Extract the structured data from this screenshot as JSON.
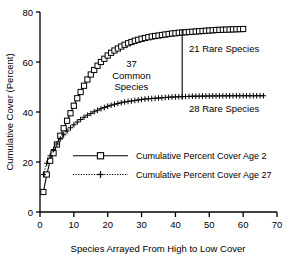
{
  "chart_data": {
    "type": "line",
    "title": "",
    "xlabel": "Species Arrayed From High to Low Cover",
    "ylabel": "Cumulative Cover (Percent)",
    "xlim": [
      0,
      70
    ],
    "ylim": [
      0,
      80
    ],
    "xticks": [
      0,
      10,
      20,
      30,
      40,
      50,
      60,
      70
    ],
    "yticks": [
      0,
      20,
      40,
      60,
      80
    ],
    "grid": false,
    "legend_position": "center-left-inside",
    "series": [
      {
        "name": "Cumulative Percent Cover Age 2",
        "marker": "open-square",
        "linestyle": "solid",
        "color": "#000000",
        "x": [
          1,
          2,
          3,
          4,
          5,
          6,
          7,
          8,
          9,
          10,
          11,
          12,
          13,
          14,
          15,
          16,
          17,
          18,
          19,
          20,
          21,
          22,
          23,
          24,
          25,
          26,
          27,
          28,
          29,
          30,
          31,
          32,
          33,
          34,
          35,
          36,
          37,
          38,
          39,
          40,
          41,
          42,
          43,
          44,
          45,
          46,
          47,
          48,
          49,
          50,
          51,
          52,
          53,
          54,
          55,
          56,
          57,
          58,
          59,
          60
        ],
        "y": [
          8.0,
          15.0,
          20.5,
          23.5,
          27.0,
          30.5,
          33.5,
          36.5,
          39.5,
          42.5,
          45.5,
          48.0,
          50.5,
          53.0,
          55.0,
          56.8,
          58.5,
          60.0,
          61.3,
          62.6,
          63.7,
          64.6,
          65.4,
          66.2,
          66.9,
          67.5,
          68.0,
          68.5,
          68.9,
          69.3,
          69.6,
          69.9,
          70.2,
          70.4,
          70.6,
          70.8,
          71.0,
          71.2,
          71.4,
          71.5,
          71.7,
          71.8,
          71.9,
          72.0,
          72.1,
          72.2,
          72.3,
          72.4,
          72.5,
          72.6,
          72.7,
          72.8,
          72.85,
          72.9,
          72.95,
          73.0,
          73.05,
          73.1,
          73.15,
          73.2
        ]
      },
      {
        "name": "Cumulative Percent Cover Age 27",
        "marker": "plus",
        "linestyle": "dotted",
        "color": "#000000",
        "x": [
          1,
          2,
          3,
          4,
          5,
          6,
          7,
          8,
          9,
          10,
          11,
          12,
          13,
          14,
          15,
          16,
          17,
          18,
          19,
          20,
          21,
          22,
          23,
          24,
          25,
          26,
          27,
          28,
          29,
          30,
          31,
          32,
          33,
          34,
          35,
          36,
          37,
          38,
          39,
          40,
          41,
          42,
          43,
          44,
          45,
          46,
          47,
          48,
          49,
          50,
          51,
          52,
          53,
          54,
          55,
          56,
          57,
          58,
          59,
          60,
          61,
          62,
          63,
          64,
          65,
          66
        ],
        "y": [
          15.0,
          19.5,
          22.5,
          25.0,
          27.2,
          29.2,
          30.9,
          32.4,
          33.7,
          34.9,
          36.0,
          37.0,
          37.9,
          38.7,
          39.4,
          40.1,
          40.7,
          41.3,
          41.8,
          42.3,
          42.7,
          43.1,
          43.4,
          43.7,
          44.0,
          44.2,
          44.4,
          44.6,
          44.8,
          45.0,
          45.2,
          45.3,
          45.4,
          45.5,
          45.6,
          45.7,
          45.8,
          45.9,
          46.0,
          46.05,
          46.1,
          46.15,
          46.2,
          46.25,
          46.3,
          46.32,
          46.34,
          46.36,
          46.38,
          46.4,
          46.42,
          46.44,
          46.45,
          46.46,
          46.47,
          46.48,
          46.49,
          46.5,
          46.5,
          46.5,
          46.5,
          46.5,
          46.5,
          46.5,
          46.5,
          46.5
        ]
      }
    ],
    "annotations": [
      {
        "name": "common-species",
        "text_lines": [
          "37",
          "Common",
          "Species"
        ],
        "x": 27,
        "y": 58
      },
      {
        "name": "rare-species-age2",
        "text": "21 Rare Species",
        "x": 44,
        "y": 64
      },
      {
        "name": "rare-species-age27",
        "text": "28 Rare Species",
        "x": 44,
        "y": 40
      },
      {
        "name": "divider",
        "type": "vline",
        "x": 42,
        "y_from": 45.0,
        "y_to": 73.0
      }
    ]
  },
  "labels": {
    "ylabel": "Cumulative Cover (Percent)",
    "xlabel": "Species Arrayed From High to Low Cover",
    "common_count": "37",
    "common_word": "Common",
    "species_word": "Species",
    "rare_top": "21 Rare Species",
    "rare_bottom": "28 Rare Species",
    "legend_1": "Cumulative Percent Cover Age 2",
    "legend_2": "Cumulative Percent Cover Age 27",
    "x_ticks": [
      "0",
      "10",
      "20",
      "30",
      "40",
      "50",
      "60",
      "70"
    ],
    "y_ticks": [
      "0",
      "20",
      "40",
      "60",
      "80"
    ]
  }
}
